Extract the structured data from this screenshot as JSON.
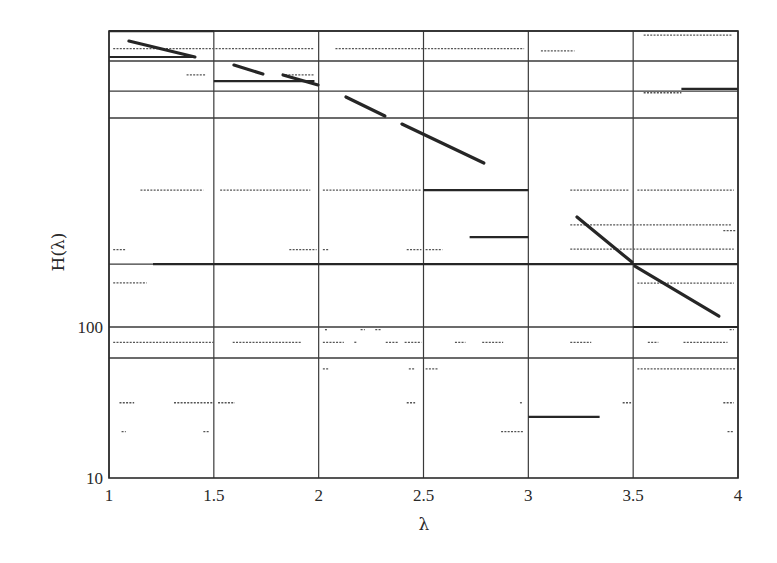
{
  "chart_data": {
    "type": "line",
    "title": "",
    "xlabel": "λ",
    "ylabel": "H(λ)",
    "xscale": "linear",
    "yscale": "log",
    "xlim": [
      1,
      4
    ],
    "ylim": [
      10,
      9120
    ],
    "grid": true,
    "legend": null,
    "x_ticks": [
      {
        "value": 1,
        "label": "1"
      },
      {
        "value": 1.5,
        "label": "1.5"
      },
      {
        "value": 2,
        "label": "2"
      },
      {
        "value": 2.5,
        "label": "2.5"
      },
      {
        "value": 3,
        "label": "3"
      },
      {
        "value": 3.5,
        "label": "3.5"
      },
      {
        "value": 4,
        "label": "4"
      }
    ],
    "y_ticks": [
      {
        "value": 10,
        "label": "10"
      },
      {
        "value": 100,
        "label": "100"
      }
    ],
    "horizontal_gridlines": [
      9120,
      5770,
      3650,
      2420,
      261,
      100,
      62.4
    ],
    "vertical_gridlines": [
      1,
      1.5,
      2,
      2.5,
      3,
      3.5,
      4
    ],
    "series": [
      {
        "name": "decreasing-segments",
        "style": "solid-thick",
        "segments": [
          [
            1.095,
            7830,
            1.41,
            6140
          ],
          [
            1.596,
            5430,
            1.734,
            4735
          ],
          [
            1.83,
            4670,
            1.997,
            4010
          ],
          [
            2.13,
            3334,
            2.316,
            2496
          ],
          [
            2.397,
            2208,
            2.788,
            1219
          ],
          [
            3.232,
            535,
            3.494,
            269
          ],
          [
            3.508,
            253,
            3.909,
            118
          ]
        ]
      },
      {
        "name": "constant-segments",
        "style": "solid",
        "segments": [
          [
            1.0,
            9120,
            1.5,
            9120
          ],
          [
            1.0,
            6140,
            1.41,
            6140
          ],
          [
            1.5,
            4255,
            1.98,
            4255
          ],
          [
            2.5,
            807,
            3.0,
            807
          ],
          [
            2.72,
            394,
            3.0,
            394
          ],
          [
            1.21,
            261,
            4.0,
            261
          ],
          [
            3.0,
            25.4,
            3.34,
            25.4
          ],
          [
            3.5,
            100,
            4.0,
            100
          ],
          [
            3.73,
            3770,
            4.0,
            3770
          ]
        ]
      },
      {
        "name": "sparse-points",
        "style": "dotted",
        "segments": [
          [
            1.02,
            6980,
            1.98,
            6980
          ],
          [
            2.08,
            6980,
            2.98,
            6980
          ],
          [
            3.06,
            6750,
            3.22,
            6750
          ],
          [
            3.55,
            8580,
            3.97,
            8580
          ],
          [
            1.37,
            4670,
            1.46,
            4670
          ],
          [
            1.84,
            4680,
            1.98,
            4680
          ],
          [
            3.55,
            3560,
            3.73,
            3560
          ],
          [
            1.15,
            807,
            1.45,
            807
          ],
          [
            1.53,
            807,
            1.96,
            807
          ],
          [
            2.02,
            807,
            2.49,
            807
          ],
          [
            3.2,
            807,
            3.48,
            807
          ],
          [
            3.52,
            807,
            3.98,
            807
          ],
          [
            3.2,
            475,
            3.5,
            475
          ],
          [
            3.5,
            475,
            3.97,
            475
          ],
          [
            3.2,
            328,
            3.5,
            328
          ],
          [
            3.5,
            328,
            3.98,
            328
          ],
          [
            3.52,
            195,
            3.98,
            195
          ],
          [
            1.02,
            325,
            1.08,
            325
          ],
          [
            1.86,
            325,
            1.99,
            325
          ],
          [
            2.02,
            325,
            2.05,
            325
          ],
          [
            2.42,
            325,
            2.49,
            325
          ],
          [
            2.51,
            325,
            2.59,
            325
          ],
          [
            3.93,
            435,
            3.99,
            435
          ],
          [
            1.02,
            196,
            1.18,
            196
          ],
          [
            1.02,
            79.2,
            1.5,
            79.2
          ],
          [
            1.59,
            79.2,
            1.92,
            79.2
          ],
          [
            2.02,
            79.2,
            2.12,
            79.2
          ],
          [
            2.17,
            79.2,
            2.18,
            79.2
          ],
          [
            2.32,
            79.2,
            2.38,
            79.2
          ],
          [
            2.41,
            79.2,
            2.49,
            79.2
          ],
          [
            2.65,
            79.2,
            2.7,
            79.2
          ],
          [
            2.78,
            79.2,
            2.88,
            79.2
          ],
          [
            3.2,
            79.2,
            3.3,
            79.2
          ],
          [
            3.57,
            79.2,
            3.62,
            79.2
          ],
          [
            3.74,
            79.2,
            3.95,
            79.2
          ],
          [
            2.03,
            96,
            2.04,
            96
          ],
          [
            2.2,
            96,
            2.22,
            96
          ],
          [
            2.27,
            96,
            2.3,
            96
          ],
          [
            3.96,
            96,
            3.98,
            96
          ],
          [
            2.02,
            52.8,
            2.05,
            52.8
          ],
          [
            2.43,
            52.8,
            2.46,
            52.8
          ],
          [
            2.51,
            52.8,
            2.57,
            52.8
          ],
          [
            3.52,
            52.8,
            3.99,
            52.8
          ],
          [
            1.05,
            31.5,
            1.12,
            31.5
          ],
          [
            1.31,
            31.5,
            1.5,
            31.5
          ],
          [
            1.52,
            31.5,
            1.6,
            31.5
          ],
          [
            2.42,
            31.5,
            2.46,
            31.5
          ],
          [
            2.96,
            31.5,
            2.97,
            31.5
          ],
          [
            3.45,
            31.5,
            3.49,
            31.5
          ],
          [
            3.93,
            31.5,
            3.98,
            31.5
          ],
          [
            1.06,
            20.3,
            1.08,
            20.3
          ],
          [
            1.45,
            20.3,
            1.48,
            20.3
          ],
          [
            2.87,
            20.3,
            2.98,
            20.3
          ],
          [
            3.95,
            20.3,
            3.98,
            20.3
          ]
        ]
      }
    ]
  }
}
